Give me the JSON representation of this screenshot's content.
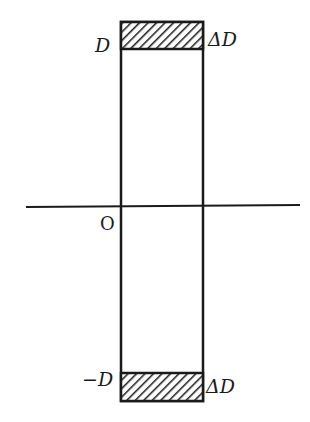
{
  "diagram": {
    "type": "band-rectangle",
    "axis": {
      "origin_label": "O"
    },
    "labels": {
      "top_level": "D",
      "top_width": "ΔD",
      "bottom_level": "−D",
      "bottom_width": "ΔD"
    },
    "colors": {
      "ink": "#1a1a1a",
      "background": "#ffffff"
    }
  }
}
